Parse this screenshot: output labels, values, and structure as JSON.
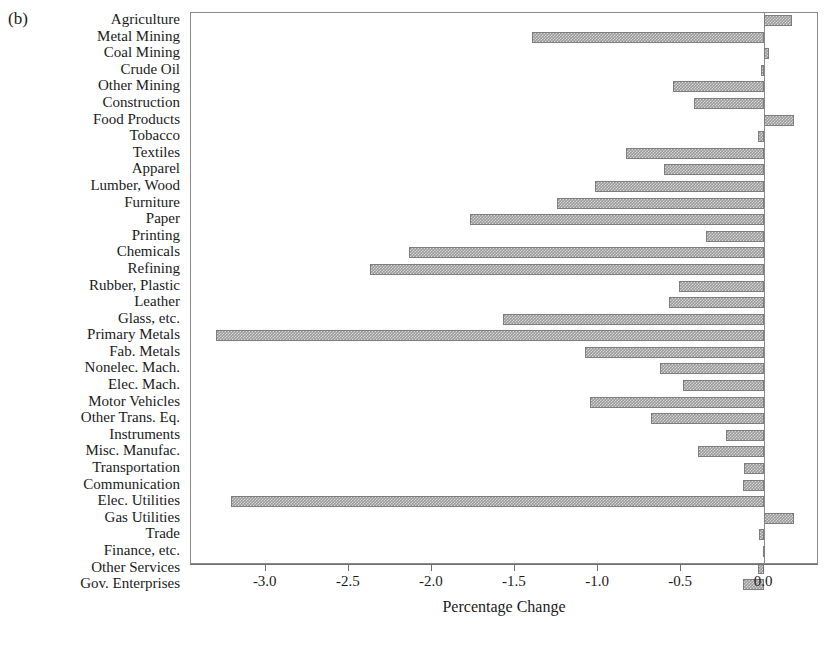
{
  "panel": {
    "label": "(b)"
  },
  "chart_data": {
    "type": "bar",
    "orientation": "horizontal",
    "title": "",
    "subtitle": "",
    "xlabel": "Percentage Change",
    "ylabel": "",
    "xlim": [
      -3.45,
      0.33
    ],
    "xticks": [
      -3.0,
      -2.5,
      -2.0,
      -1.5,
      -1.0,
      -0.5,
      0.0
    ],
    "xticklabels": [
      "-3.0",
      "-2.5",
      "-2.0",
      "-1.5",
      "-1.0",
      "-0.5",
      "0.0"
    ],
    "grid": false,
    "legend": null,
    "bar_color": "#9a9a9a",
    "bar_hatch": "cross-hatch",
    "zero_line": 0.0,
    "categories": [
      "Agriculture",
      "Metal Mining",
      "Coal Mining",
      "Crude Oil",
      "Other Mining",
      "Construction",
      "Food Products",
      "Tobacco",
      "Textiles",
      "Apparel",
      "Lumber, Wood",
      "Furniture",
      "Paper",
      "Printing",
      "Chemicals",
      "Refining",
      "Rubber, Plastic",
      "Leather",
      "Glass, etc.",
      "Primary Metals",
      "Fab. Metals",
      "Nonelec. Mach.",
      "Elec. Mach.",
      "Motor Vehicles",
      "Other Trans. Eq.",
      "Instruments",
      "Misc. Manufac.",
      "Transportation",
      "Communication",
      "Elec. Utilities",
      "Gas Utilities",
      "Trade",
      "Finance, etc.",
      "Other Services",
      "Gov. Enterprises"
    ],
    "values": [
      0.17,
      -1.4,
      0.03,
      -0.02,
      -0.55,
      -0.42,
      0.18,
      -0.04,
      -0.83,
      -0.6,
      -1.02,
      -1.25,
      -1.77,
      -0.35,
      -2.14,
      -2.37,
      -0.51,
      -0.57,
      -1.57,
      -3.3,
      -1.08,
      -0.63,
      -0.49,
      -1.05,
      -0.68,
      -0.23,
      -0.4,
      -0.12,
      -0.13,
      -3.21,
      0.18,
      -0.03,
      -0.01,
      -0.04,
      -0.13
    ]
  }
}
